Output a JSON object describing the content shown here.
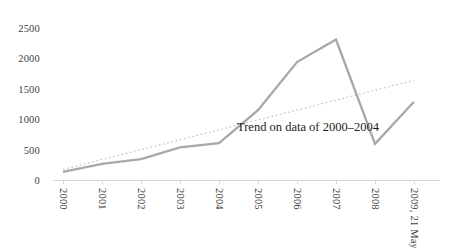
{
  "chart_data": {
    "type": "line",
    "title": "",
    "xlabel": "",
    "ylabel": "",
    "categories": [
      "2000",
      "2001",
      "2002",
      "2003",
      "2004",
      "2005",
      "2006",
      "2007",
      "2008",
      "2009, 21 May"
    ],
    "series": [
      {
        "name": "data-series",
        "style": "solid",
        "color": "#a8a8a8",
        "values": [
          150,
          280,
          360,
          550,
          620,
          1160,
          1950,
          2320,
          610,
          1300
        ]
      },
      {
        "name": "linear-trend",
        "style": "dotted",
        "color": "#c3c3c3",
        "start_value": 190,
        "end_value": 1650
      }
    ],
    "yticks": [
      0,
      500,
      1000,
      1500,
      2000,
      2500
    ],
    "ylim": [
      0,
      2500
    ],
    "gridlines": false,
    "legend": "none",
    "annotation": "Trend on data of 2000–2004",
    "axis_color": "#d6d6d6",
    "label_color": "#3f3f3f",
    "annotation_color": "#1c1c1c",
    "background": "#ffffff"
  }
}
